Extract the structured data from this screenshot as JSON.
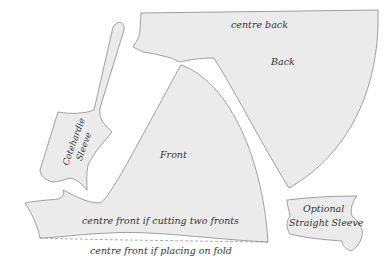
{
  "diagram": {
    "type": "sewing-pattern-layout",
    "colors": {
      "piece_fill": "#ebebeb",
      "outline": "#8a8a8a",
      "text": "#333333",
      "background": "#ffffff"
    },
    "pieces": {
      "back": {
        "label": "Back",
        "edge_label": "centre back"
      },
      "front": {
        "label": "Front",
        "edge_label": "centre front if cutting two fronts",
        "fold_label": "centre front if placing on fold"
      },
      "cotehardie_sleeve": {
        "label_line1": "Cotehardie",
        "label_line2": "Sleeve"
      },
      "straight_sleeve": {
        "label_line1": "Optional",
        "label_line2": "Straight Sleeve"
      }
    }
  }
}
